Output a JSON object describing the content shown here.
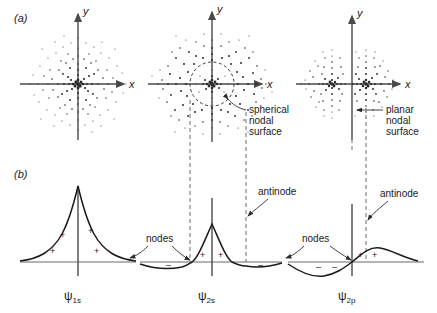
{
  "figure": {
    "rows": [
      {
        "key": "a",
        "label": "(a)",
        "description": "electron probability density dot clouds"
      },
      {
        "key": "b",
        "label": "(b)",
        "description": "wavefunction amplitude cross sections"
      }
    ],
    "axis_labels": {
      "x": "x",
      "y": "y"
    },
    "columns": [
      {
        "orbital": "1s",
        "psi_symbol": "ψ",
        "psi_subscript": "1s",
        "cloud": {
          "type": "spherical",
          "nodes": 0,
          "lobes": 1
        },
        "wavefunction": {
          "shape": "cusped-exponential-peak",
          "sign_regions": [
            {
              "sign": "+",
              "count": 4
            }
          ],
          "annotations": []
        }
      },
      {
        "orbital": "2s",
        "psi_symbol": "ψ",
        "psi_subscript": "2s",
        "cloud": {
          "type": "spherical-with-inner-shell",
          "nodes": 1,
          "lobes": 1
        },
        "nodal_surface_label": "spherical\nnodal\nsurface",
        "nodal_surface_lines": [
          "spherical",
          "nodal",
          "surface"
        ],
        "wavefunction": {
          "shape": "central-peak-with-negative-outer-lobes",
          "sign_regions": [
            {
              "sign": "+",
              "count": 2
            },
            {
              "sign": "–",
              "count": 2
            }
          ],
          "annotations": [
            "nodes",
            "antinode"
          ]
        }
      },
      {
        "orbital": "2p",
        "psi_symbol": "ψ",
        "psi_subscript": "2p",
        "cloud": {
          "type": "two-lobed-dumbbell",
          "nodes": 1,
          "lobes": 2
        },
        "nodal_surface_label": "planar\nnodal\nsurface",
        "nodal_surface_lines": [
          "planar",
          "nodal",
          "surface"
        ],
        "wavefunction": {
          "shape": "antisymmetric-negative-left-positive-right",
          "sign_regions": [
            {
              "sign": "–",
              "count": 2
            },
            {
              "sign": "+",
              "count": 2
            }
          ],
          "annotations": [
            "nodes",
            "antinode"
          ]
        }
      }
    ],
    "annotations": {
      "spherical_nodal_surface": [
        "spherical",
        "nodal",
        "surface"
      ],
      "planar_nodal_surface": [
        "planar",
        "nodal",
        "surface"
      ],
      "antinode": "antinode",
      "nodes": "nodes"
    },
    "colors": {
      "ink": "#1a1a1a",
      "axis": "#4a4a4a",
      "dashed": "#7a7a7a",
      "dot": "#2b2b2b",
      "background": "#ffffff"
    }
  }
}
